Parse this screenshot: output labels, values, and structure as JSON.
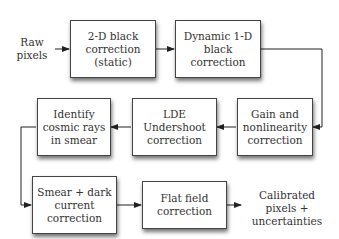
{
  "diagram": {
    "type": "flowchart",
    "input": {
      "lines": [
        "Raw",
        "pixels"
      ]
    },
    "output": {
      "lines": [
        "Calibrated",
        "pixels +",
        "uncertainties"
      ]
    },
    "steps": [
      {
        "id": "black-2d",
        "lines": [
          "2-D black",
          "correction",
          "(static)"
        ]
      },
      {
        "id": "black-1d",
        "lines": [
          "Dynamic 1-D",
          "black",
          "correction"
        ]
      },
      {
        "id": "gain",
        "lines": [
          "Gain and",
          "nonlinearity",
          "correction"
        ]
      },
      {
        "id": "lde",
        "lines": [
          "LDE",
          "Undershoot",
          "correction"
        ]
      },
      {
        "id": "cosmic",
        "lines": [
          "Identify",
          "cosmic rays",
          "in smear"
        ]
      },
      {
        "id": "smear",
        "lines": [
          "Smear + dark",
          "current",
          "correction"
        ]
      },
      {
        "id": "flat",
        "lines": [
          "Flat field",
          "correction"
        ]
      }
    ],
    "edges": [
      [
        "input",
        "black-2d"
      ],
      [
        "black-2d",
        "black-1d"
      ],
      [
        "black-1d",
        "gain"
      ],
      [
        "gain",
        "lde"
      ],
      [
        "lde",
        "cosmic"
      ],
      [
        "cosmic",
        "smear"
      ],
      [
        "smear",
        "flat"
      ],
      [
        "flat",
        "output"
      ]
    ],
    "colors": {
      "line": "#222222",
      "box_border": "#444444",
      "text": "#333333"
    }
  }
}
